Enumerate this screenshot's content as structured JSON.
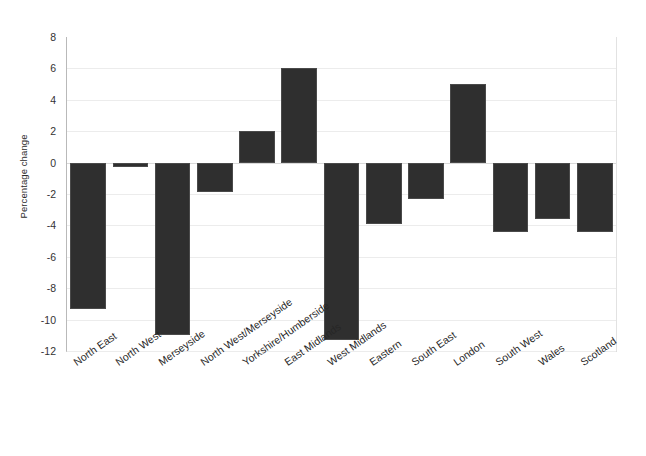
{
  "chart_data": {
    "type": "bar",
    "title": "",
    "subtitle": "",
    "xlabel": "",
    "ylabel": "Percentage change",
    "ylim": [
      -12,
      8
    ],
    "ytick_step": 2,
    "yticks": [
      8,
      6,
      4,
      2,
      0,
      -2,
      -4,
      -6,
      -8,
      -10,
      -12
    ],
    "ytick_labels": [
      "8",
      "6",
      "4",
      "2",
      "0",
      "-2",
      "-4",
      "-6",
      "-8",
      "-10",
      "-12"
    ],
    "grid": true,
    "grid_axis": "y",
    "legend": false,
    "legend_position": "none",
    "bar_color": "#2f2f2f",
    "background_color": "#ffffff",
    "gridline_color": "#ececec",
    "categories": [
      "North East",
      "North West",
      "Merseyside",
      "North West/Merseyside",
      "Yorkshire/Humberside",
      "East Midlands",
      "West Midlands",
      "Eastern",
      "South East",
      "London",
      "South West",
      "Wales",
      "Scotland"
    ],
    "values": [
      -9.3,
      -0.3,
      -11.0,
      -1.9,
      2.0,
      6.0,
      -11.3,
      -3.9,
      -2.3,
      5.0,
      -4.4,
      -3.6,
      -4.4
    ],
    "annotations": []
  }
}
